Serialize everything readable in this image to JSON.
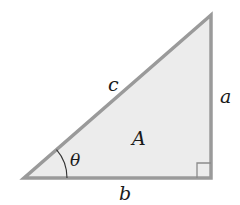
{
  "diagram": {
    "type": "right-triangle",
    "colors": {
      "stroke": "#9a9a9a",
      "fill": "#ececec",
      "arc": "#333333",
      "text": "#1a1a1a"
    },
    "labels": {
      "hypotenuse": "c",
      "opposite": "a",
      "adjacent": "b",
      "area": "A",
      "angle": "θ"
    },
    "right_angle_marker": true
  }
}
